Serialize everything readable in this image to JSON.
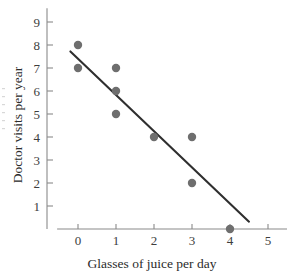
{
  "chart_data": {
    "type": "scatter",
    "title": "",
    "xlabel": "Glasses of juice per day",
    "ylabel": "Doctor visits per year",
    "xlim": [
      -0.55,
      5.5
    ],
    "ylim": [
      0,
      9.6
    ],
    "xticks": [
      "0",
      "1",
      "2",
      "3",
      "4",
      "5"
    ],
    "xtick_values": [
      0,
      1,
      2,
      3,
      4,
      5
    ],
    "yticks": [
      "1",
      "2",
      "3",
      "4",
      "5",
      "6",
      "7",
      "8",
      "9"
    ],
    "ytick_values": [
      1,
      2,
      3,
      4,
      5,
      6,
      7,
      8,
      9
    ],
    "grid": false,
    "legend": "none",
    "points": [
      {
        "x": 0,
        "y": 8
      },
      {
        "x": 0,
        "y": 7
      },
      {
        "x": 1,
        "y": 7
      },
      {
        "x": 1,
        "y": 6
      },
      {
        "x": 1,
        "y": 5
      },
      {
        "x": 2,
        "y": 4
      },
      {
        "x": 3,
        "y": 4
      },
      {
        "x": 3,
        "y": 2
      },
      {
        "x": 4,
        "y": 0
      }
    ],
    "point_color": "#6e6e6e",
    "point_radius": 4.2,
    "trend_line": {
      "x1": -0.2,
      "y1": 7.72,
      "x2": 4.5,
      "y2": 0.32,
      "color": "#2f2f2f"
    },
    "axis_color": "#8a8a8a"
  }
}
